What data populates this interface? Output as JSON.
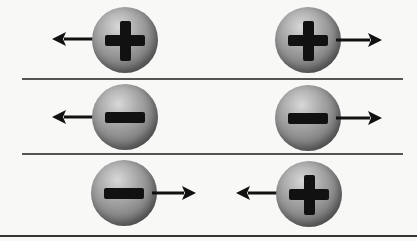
{
  "diagram": {
    "colors": {
      "background": "#f8f8f6",
      "divider": "#555555",
      "sphere_light": "#d8d8d8",
      "sphere_dark": "#5a5a5a",
      "sign": "#111111",
      "arrow": "#111111"
    },
    "rows": [
      {
        "name": "positive-positive-repel",
        "left": {
          "charge": "+",
          "arrow": "left"
        },
        "right": {
          "charge": "+",
          "arrow": "right"
        }
      },
      {
        "name": "negative-negative-repel",
        "left": {
          "charge": "-",
          "arrow": "left"
        },
        "right": {
          "charge": "-",
          "arrow": "right"
        }
      },
      {
        "name": "negative-positive-attract",
        "left": {
          "charge": "-",
          "arrow": "right"
        },
        "right": {
          "charge": "+",
          "arrow": "left"
        }
      }
    ]
  }
}
